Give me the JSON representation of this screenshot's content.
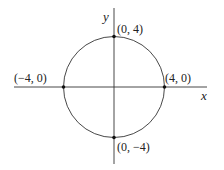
{
  "diagram": {
    "type": "circle-on-coordinate-axes",
    "axes": {
      "x_label": "x",
      "y_label": "y"
    },
    "circle": {
      "center": [
        0,
        0
      ],
      "radius": 4
    },
    "points": [
      {
        "label": "(0, 4)",
        "x": 0,
        "y": 4
      },
      {
        "label": "(−4, 0)",
        "x": -4,
        "y": 0
      },
      {
        "label": "(4, 0)",
        "x": 4,
        "y": 0
      },
      {
        "label": "(0, −4)",
        "x": 0,
        "y": -4
      }
    ],
    "colors": {
      "stroke": "#333333",
      "background": "#ffffff"
    }
  }
}
